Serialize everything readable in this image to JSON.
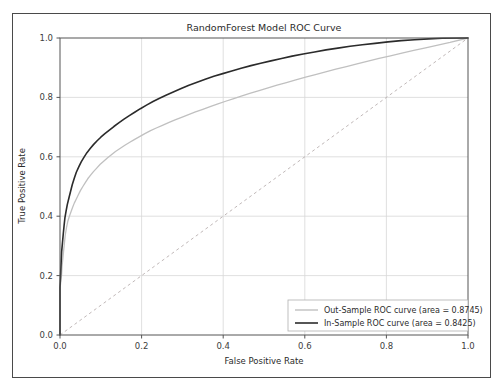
{
  "chart_data": {
    "type": "line",
    "title": "RandomForest Model ROC Curve",
    "xlabel": "False Positive Rate",
    "ylabel": "True Positive Rate",
    "xlim": [
      0.0,
      1.0
    ],
    "ylim": [
      0.0,
      1.0
    ],
    "grid": true,
    "legend_position": "lower right",
    "xticks": [
      "0.0",
      "0.2",
      "0.4",
      "0.6",
      "0.8",
      "1.0"
    ],
    "xtick_values": [
      0.0,
      0.2,
      0.4,
      0.6,
      0.8,
      1.0
    ],
    "yticks": [
      "0.0",
      "0.2",
      "0.4",
      "0.6",
      "0.8",
      "1.0"
    ],
    "ytick_values": [
      0.0,
      0.2,
      0.4,
      0.6,
      0.8,
      1.0
    ],
    "reference_line": {
      "name": "chance-diagonal",
      "style": "dashed",
      "color": "#b9b0b0",
      "x": [
        0.0,
        1.0
      ],
      "y": [
        0.0,
        1.0
      ]
    },
    "series": [
      {
        "name": "Out-Sample ROC curve",
        "legend_label": "Out-Sample ROC curve (area = 0.8745)",
        "area": 0.8745,
        "color": "#c0c0c0",
        "x": [
          0.0,
          0.0,
          0.002,
          0.004,
          0.005,
          0.007,
          0.009,
          0.011,
          0.013,
          0.016,
          0.019,
          0.023,
          0.027,
          0.031,
          0.035,
          0.04,
          0.045,
          0.05,
          0.056,
          0.062,
          0.068,
          0.075,
          0.082,
          0.09,
          0.098,
          0.107,
          0.116,
          0.126,
          0.136,
          0.147,
          0.158,
          0.17,
          0.182,
          0.195,
          0.208,
          0.222,
          0.236,
          0.251,
          0.266,
          0.282,
          0.298,
          0.315,
          0.332,
          0.35,
          0.368,
          0.387,
          0.406,
          0.426,
          0.446,
          0.467,
          0.488,
          0.51,
          0.532,
          0.555,
          0.578,
          0.602,
          0.626,
          0.651,
          0.676,
          0.702,
          0.728,
          0.755,
          0.782,
          0.81,
          0.838,
          0.867,
          0.896,
          0.926,
          0.956,
          1.0
        ],
        "y": [
          0.0,
          0.155,
          0.18,
          0.205,
          0.232,
          0.258,
          0.285,
          0.312,
          0.338,
          0.362,
          0.382,
          0.4,
          0.415,
          0.43,
          0.444,
          0.458,
          0.472,
          0.486,
          0.5,
          0.513,
          0.526,
          0.538,
          0.55,
          0.562,
          0.574,
          0.585,
          0.596,
          0.607,
          0.618,
          0.628,
          0.638,
          0.648,
          0.658,
          0.668,
          0.678,
          0.688,
          0.697,
          0.706,
          0.715,
          0.724,
          0.733,
          0.742,
          0.751,
          0.76,
          0.769,
          0.778,
          0.787,
          0.796,
          0.805,
          0.814,
          0.823,
          0.832,
          0.841,
          0.85,
          0.859,
          0.868,
          0.877,
          0.886,
          0.895,
          0.904,
          0.913,
          0.922,
          0.931,
          0.94,
          0.949,
          0.958,
          0.967,
          0.976,
          0.985,
          1.0
        ]
      },
      {
        "name": "In-Sample ROC curve",
        "legend_label": "In-Sample ROC curve (area = 0.8425)",
        "area": 0.8425,
        "color": "#2b2b2b",
        "x": [
          0.0,
          0.0,
          0.001,
          0.002,
          0.003,
          0.004,
          0.006,
          0.008,
          0.01,
          0.012,
          0.015,
          0.018,
          0.022,
          0.026,
          0.03,
          0.035,
          0.04,
          0.046,
          0.052,
          0.059,
          0.066,
          0.074,
          0.082,
          0.091,
          0.1,
          0.11,
          0.121,
          0.132,
          0.144,
          0.156,
          0.169,
          0.183,
          0.197,
          0.212,
          0.228,
          0.244,
          0.261,
          0.279,
          0.297,
          0.316,
          0.336,
          0.356,
          0.377,
          0.399,
          0.421,
          0.444,
          0.468,
          0.492,
          0.517,
          0.543,
          0.569,
          0.596,
          0.624,
          0.652,
          0.681,
          0.711,
          0.741,
          0.772,
          0.804,
          0.836,
          0.869,
          0.903,
          0.937,
          1.0
        ],
        "y": [
          0.0,
          0.16,
          0.19,
          0.22,
          0.25,
          0.28,
          0.31,
          0.34,
          0.368,
          0.394,
          0.418,
          0.44,
          0.462,
          0.484,
          0.506,
          0.528,
          0.548,
          0.566,
          0.583,
          0.599,
          0.614,
          0.628,
          0.641,
          0.654,
          0.666,
          0.678,
          0.69,
          0.702,
          0.714,
          0.726,
          0.738,
          0.75,
          0.762,
          0.774,
          0.786,
          0.797,
          0.808,
          0.819,
          0.83,
          0.841,
          0.851,
          0.861,
          0.871,
          0.88,
          0.889,
          0.898,
          0.907,
          0.915,
          0.923,
          0.931,
          0.939,
          0.946,
          0.953,
          0.96,
          0.966,
          0.972,
          0.977,
          0.982,
          0.987,
          0.991,
          0.994,
          0.997,
          0.999,
          1.0
        ]
      }
    ]
  }
}
